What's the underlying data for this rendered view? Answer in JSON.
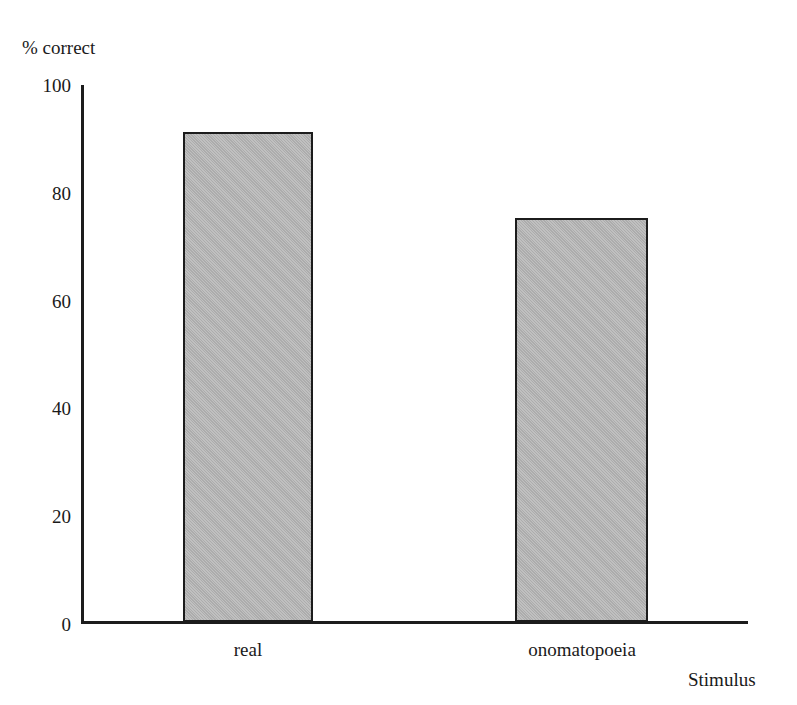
{
  "chart_data": {
    "type": "bar",
    "title": "",
    "xlabel": "Stimulus",
    "ylabel": "% correct",
    "categories": [
      "real",
      "onomatopoeia"
    ],
    "values": [
      91,
      75
    ],
    "ylim": [
      0,
      100
    ],
    "yticks": [
      100,
      80,
      60,
      40,
      20,
      0
    ],
    "ytick_labels": [
      "100",
      "80",
      "60",
      "40",
      "20",
      "0"
    ],
    "grid": false,
    "legend": null,
    "bar_fill_color": "#b4b4b4",
    "bar_edge_color": "#1c1c1c",
    "axis_color": "#1c1c1c",
    "background_color": "#ffffff"
  }
}
